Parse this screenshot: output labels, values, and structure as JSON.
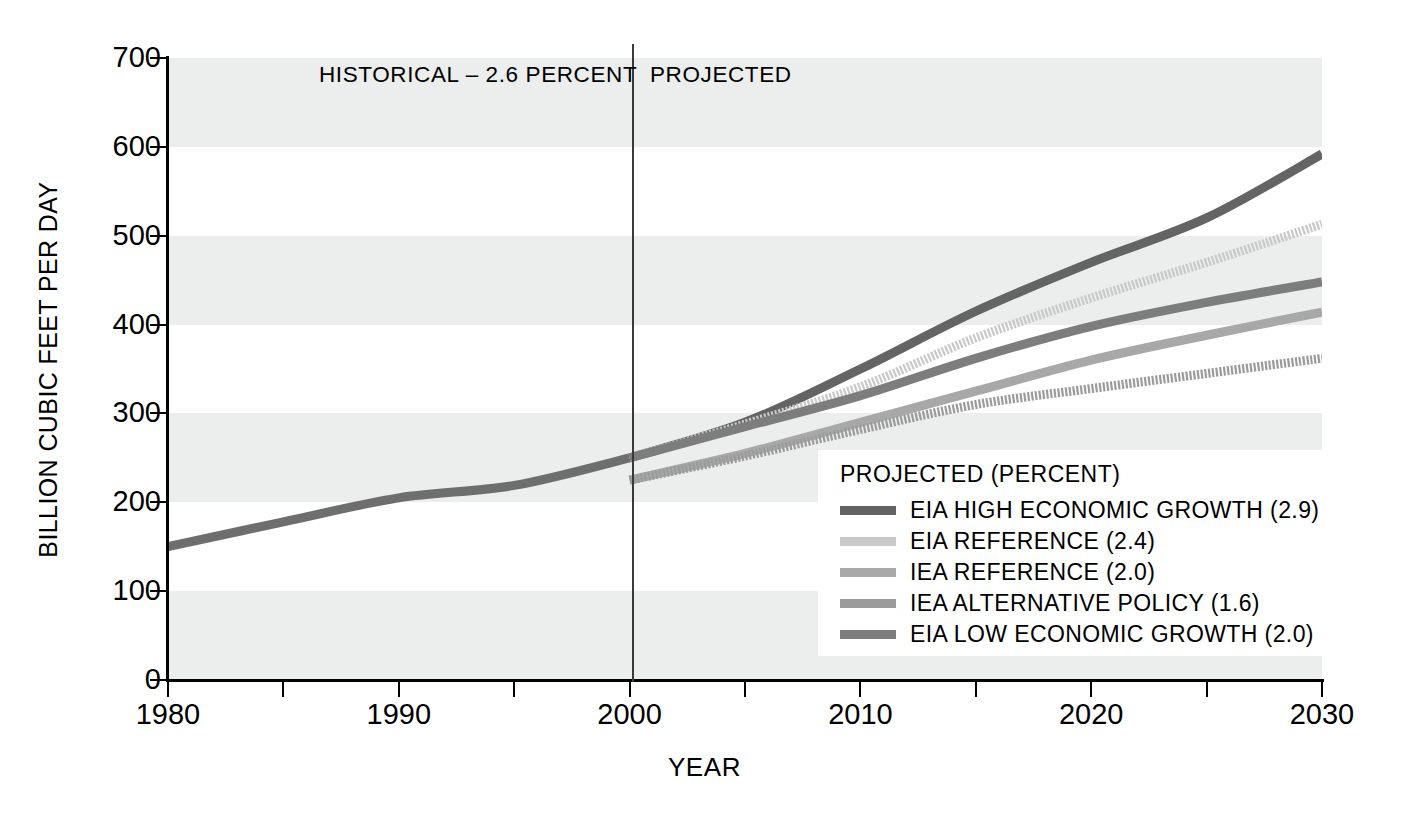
{
  "chart_data": {
    "type": "line",
    "title": "",
    "xlabel": "YEAR",
    "ylabel": "BILLION CUBIC FEET PER DAY",
    "xlim": [
      1980,
      2030
    ],
    "ylim": [
      0,
      700
    ],
    "xticks": [
      1980,
      1985,
      1990,
      1995,
      2000,
      2005,
      2010,
      2015,
      2020,
      2025,
      2030
    ],
    "xtick_labels": [
      "1980",
      "",
      "1990",
      "",
      "2000",
      "",
      "2010",
      "",
      "2020",
      "",
      "2030"
    ],
    "yticks": [
      0,
      100,
      200,
      300,
      400,
      500,
      600,
      700
    ],
    "ytick_labels": [
      "0",
      "100",
      "200",
      "300",
      "400",
      "500",
      "600",
      "700"
    ],
    "grid": "alternating horizontal gray bands every 100 units",
    "legend_position": "lower right",
    "divider_year": 2000,
    "annotations": [
      {
        "text": "HISTORICAL – 2.6 PERCENT",
        "x": 1993,
        "y": 680
      },
      {
        "text": "PROJECTED",
        "x": 2001.5,
        "y": 680
      }
    ],
    "series": [
      {
        "name": "HISTORICAL",
        "legend": false,
        "color": "#6e6e6e",
        "style": "solid",
        "x": [
          1980,
          1985,
          1990,
          1995,
          2000
        ],
        "values": [
          150,
          178,
          205,
          219,
          250
        ]
      },
      {
        "name": "EIA HIGH ECONOMIC GROWTH (2.9)",
        "legend": true,
        "color": "#646464",
        "style": "solid",
        "x": [
          2000,
          2005,
          2010,
          2015,
          2020,
          2025,
          2030
        ],
        "values": [
          250,
          290,
          350,
          415,
          470,
          520,
          592
        ]
      },
      {
        "name": "EIA REFERENCE (2.4)",
        "legend": true,
        "color": "#c9c9c9",
        "style": "dotted",
        "x": [
          2000,
          2005,
          2010,
          2015,
          2020,
          2025,
          2030
        ],
        "values": [
          250,
          288,
          330,
          385,
          430,
          470,
          513
        ]
      },
      {
        "name": "IEA REFERENCE (2.0)",
        "legend": true,
        "color": "#a8a8a8",
        "style": "solid",
        "x": [
          2000,
          2005,
          2010,
          2015,
          2020,
          2025,
          2030
        ],
        "values": [
          225,
          255,
          290,
          325,
          360,
          388,
          414
        ]
      },
      {
        "name": "IEA ALTERNATIVE POLICY (1.6)",
        "legend": true,
        "color": "#9b9b9b",
        "style": "dotted",
        "x": [
          2000,
          2005,
          2010,
          2015,
          2020,
          2025,
          2030
        ],
        "values": [
          225,
          252,
          282,
          310,
          328,
          345,
          362
        ]
      },
      {
        "name": "EIA LOW ECONOMIC GROWTH (2.0)",
        "legend": true,
        "color": "#7d7d7d",
        "style": "solid",
        "x": [
          2000,
          2005,
          2010,
          2015,
          2020,
          2025,
          2030
        ],
        "values": [
          250,
          285,
          320,
          362,
          398,
          425,
          448
        ]
      }
    ]
  },
  "axes": {
    "y_title": "BILLION CUBIC FEET PER DAY",
    "x_title": "YEAR",
    "y_labels": [
      "700",
      "600",
      "500",
      "400",
      "300",
      "200",
      "100",
      "0"
    ],
    "x_labels": [
      "1980",
      "1990",
      "2000",
      "2010",
      "2020",
      "2030"
    ]
  },
  "phases": {
    "historical": "HISTORICAL – 2.6 PERCENT",
    "projected": "PROJECTED"
  },
  "legend": {
    "title": "PROJECTED (PERCENT)",
    "items": [
      {
        "label": "EIA HIGH ECONOMIC GROWTH (2.9)",
        "color": "#646464"
      },
      {
        "label": "EIA REFERENCE (2.4)",
        "color": "#c9c9c9"
      },
      {
        "label": "IEA REFERENCE (2.0)",
        "color": "#a8a8a8"
      },
      {
        "label": "IEA ALTERNATIVE POLICY (1.6)",
        "color": "#9b9b9b"
      },
      {
        "label": "EIA LOW ECONOMIC GROWTH (2.0)",
        "color": "#7d7d7d"
      }
    ]
  },
  "colors": {
    "band": "#eceded",
    "background": "#ffffff",
    "axis": "#000000",
    "divider": "#3a3a3a"
  }
}
